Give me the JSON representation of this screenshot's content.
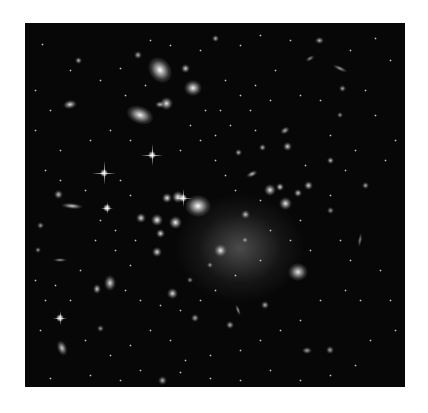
{
  "image": {
    "subject": "galaxy-cluster-deep-field",
    "description": "Black-and-white astronomical photograph of a dense galaxy cluster with a bright central concentration, elliptical galaxies, lensing arcs and diffraction-spike stars"
  },
  "galaxies": [
    {
      "x": 160,
      "y": 70,
      "w": 22,
      "h": 28,
      "rot": -35,
      "b": 1.0
    },
    {
      "x": 193,
      "y": 88,
      "w": 18,
      "h": 16,
      "rot": 0,
      "b": 0.95
    },
    {
      "x": 140,
      "y": 115,
      "w": 28,
      "h": 18,
      "rot": 20,
      "b": 0.95
    },
    {
      "x": 166,
      "y": 103,
      "w": 13,
      "h": 13,
      "rot": 0,
      "b": 0.9
    },
    {
      "x": 185,
      "y": 68,
      "w": 9,
      "h": 9,
      "rot": 0,
      "b": 0.8
    },
    {
      "x": 198,
      "y": 206,
      "w": 26,
      "h": 22,
      "rot": 0,
      "b": 1.0
    },
    {
      "x": 178,
      "y": 197,
      "w": 12,
      "h": 12,
      "rot": 0,
      "b": 0.95
    },
    {
      "x": 167,
      "y": 198,
      "w": 10,
      "h": 10,
      "rot": 0,
      "b": 0.9
    },
    {
      "x": 157,
      "y": 220,
      "w": 12,
      "h": 12,
      "rot": 0,
      "b": 0.95
    },
    {
      "x": 175,
      "y": 222,
      "w": 13,
      "h": 13,
      "rot": 0,
      "b": 0.95
    },
    {
      "x": 160,
      "y": 233,
      "w": 9,
      "h": 9,
      "rot": 0,
      "b": 0.85
    },
    {
      "x": 141,
      "y": 218,
      "w": 10,
      "h": 10,
      "rot": 0,
      "b": 0.85
    },
    {
      "x": 157,
      "y": 252,
      "w": 10,
      "h": 10,
      "rot": 0,
      "b": 0.85
    },
    {
      "x": 270,
      "y": 190,
      "w": 12,
      "h": 12,
      "rot": 0,
      "b": 0.9
    },
    {
      "x": 285,
      "y": 203,
      "w": 13,
      "h": 13,
      "rot": 0,
      "b": 0.9
    },
    {
      "x": 280,
      "y": 187,
      "w": 8,
      "h": 8,
      "rot": 0,
      "b": 0.85
    },
    {
      "x": 220,
      "y": 250,
      "w": 13,
      "h": 13,
      "rot": 0,
      "b": 0.9
    },
    {
      "x": 298,
      "y": 272,
      "w": 20,
      "h": 18,
      "rot": 0,
      "b": 0.9
    },
    {
      "x": 110,
      "y": 283,
      "w": 12,
      "h": 16,
      "rot": 0,
      "b": 0.85
    },
    {
      "x": 172,
      "y": 293,
      "w": 11,
      "h": 11,
      "rot": 0,
      "b": 0.85
    },
    {
      "x": 70,
      "y": 104,
      "w": 14,
      "h": 9,
      "rot": -10,
      "b": 0.85
    },
    {
      "x": 72,
      "y": 206,
      "w": 22,
      "h": 6,
      "rot": 5,
      "b": 0.8
    },
    {
      "x": 58,
      "y": 194,
      "w": 9,
      "h": 9,
      "rot": 0,
      "b": 0.75
    },
    {
      "x": 97,
      "y": 289,
      "w": 8,
      "h": 10,
      "rot": 0,
      "b": 0.8
    },
    {
      "x": 62,
      "y": 348,
      "w": 10,
      "h": 16,
      "rot": -20,
      "b": 0.8
    },
    {
      "x": 287,
      "y": 146,
      "w": 9,
      "h": 9,
      "rot": 0,
      "b": 0.8
    },
    {
      "x": 308,
      "y": 185,
      "w": 9,
      "h": 9,
      "rot": 0,
      "b": 0.8
    },
    {
      "x": 298,
      "y": 193,
      "w": 8,
      "h": 8,
      "rot": 0,
      "b": 0.8
    },
    {
      "x": 330,
      "y": 160,
      "w": 7,
      "h": 7,
      "rot": 0,
      "b": 0.75
    },
    {
      "x": 262,
      "y": 147,
      "w": 7,
      "h": 7,
      "rot": 0,
      "b": 0.7
    },
    {
      "x": 238,
      "y": 152,
      "w": 7,
      "h": 7,
      "rot": 0,
      "b": 0.7
    },
    {
      "x": 252,
      "y": 174,
      "w": 12,
      "h": 6,
      "rot": -25,
      "b": 0.75
    },
    {
      "x": 245,
      "y": 214,
      "w": 9,
      "h": 9,
      "rot": 0,
      "b": 0.75
    },
    {
      "x": 285,
      "y": 130,
      "w": 10,
      "h": 7,
      "rot": -30,
      "b": 0.7
    },
    {
      "x": 319,
      "y": 40,
      "w": 9,
      "h": 7,
      "rot": 0,
      "b": 0.7
    },
    {
      "x": 215,
      "y": 38,
      "w": 7,
      "h": 7,
      "rot": 0,
      "b": 0.7
    },
    {
      "x": 138,
      "y": 55,
      "w": 8,
      "h": 8,
      "rot": 0,
      "b": 0.7
    },
    {
      "x": 78,
      "y": 60,
      "w": 7,
      "h": 7,
      "rot": 0,
      "b": 0.7
    },
    {
      "x": 160,
      "y": 104,
      "w": 10,
      "h": 7,
      "rot": 0,
      "b": 0.7
    },
    {
      "x": 265,
      "y": 305,
      "w": 8,
      "h": 8,
      "rot": 0,
      "b": 0.7
    },
    {
      "x": 230,
      "y": 325,
      "w": 8,
      "h": 8,
      "rot": 0,
      "b": 0.7
    },
    {
      "x": 195,
      "y": 318,
      "w": 8,
      "h": 8,
      "rot": 0,
      "b": 0.7
    },
    {
      "x": 342,
      "y": 88,
      "w": 7,
      "h": 7,
      "rot": 0,
      "b": 0.65
    },
    {
      "x": 307,
      "y": 350,
      "w": 10,
      "h": 7,
      "rot": 0,
      "b": 0.65
    },
    {
      "x": 330,
      "y": 350,
      "w": 8,
      "h": 8,
      "rot": 0,
      "b": 0.65
    },
    {
      "x": 162,
      "y": 380,
      "w": 9,
      "h": 9,
      "rot": 0,
      "b": 0.7
    },
    {
      "x": 100,
      "y": 328,
      "w": 7,
      "h": 7,
      "rot": 0,
      "b": 0.6
    },
    {
      "x": 60,
      "y": 260,
      "w": 14,
      "h": 4,
      "rot": 0,
      "b": 0.6
    },
    {
      "x": 340,
      "y": 115,
      "w": 6,
      "h": 6,
      "rot": 0,
      "b": 0.6
    },
    {
      "x": 365,
      "y": 185,
      "w": 7,
      "h": 7,
      "rot": 0,
      "b": 0.65
    },
    {
      "x": 40,
      "y": 225,
      "w": 7,
      "h": 7,
      "rot": 0,
      "b": 0.6
    },
    {
      "x": 38,
      "y": 250,
      "w": 6,
      "h": 6,
      "rot": 0,
      "b": 0.6
    },
    {
      "x": 340,
      "y": 68,
      "w": 16,
      "h": 5,
      "rot": 25,
      "b": 0.6
    },
    {
      "x": 310,
      "y": 58,
      "w": 10,
      "h": 5,
      "rot": -30,
      "b": 0.55
    },
    {
      "x": 360,
      "y": 240,
      "w": 4,
      "h": 14,
      "rot": 10,
      "b": 0.55
    },
    {
      "x": 330,
      "y": 210,
      "w": 7,
      "h": 7,
      "rot": 0,
      "b": 0.6
    },
    {
      "x": 245,
      "y": 240,
      "w": 6,
      "h": 6,
      "rot": 0,
      "b": 0.6
    },
    {
      "x": 210,
      "y": 265,
      "w": 6,
      "h": 6,
      "rot": 0,
      "b": 0.6
    },
    {
      "x": 190,
      "y": 280,
      "w": 6,
      "h": 6,
      "rot": 0,
      "b": 0.6
    },
    {
      "x": 238,
      "y": 310,
      "w": 4,
      "h": 12,
      "rot": -20,
      "b": 0.6
    }
  ],
  "stars": [
    {
      "x": 152,
      "y": 155,
      "len": 22
    },
    {
      "x": 104,
      "y": 173,
      "len": 24
    },
    {
      "x": 183,
      "y": 198,
      "len": 18
    },
    {
      "x": 107,
      "y": 208,
      "len": 12
    },
    {
      "x": 60,
      "y": 318,
      "len": 14
    }
  ],
  "dots": [
    [
      42,
      44
    ],
    [
      70,
      70
    ],
    [
      100,
      80
    ],
    [
      120,
      68
    ],
    [
      200,
      50
    ],
    [
      240,
      45
    ],
    [
      260,
      35
    ],
    [
      290,
      40
    ],
    [
      350,
      50
    ],
    [
      375,
      38
    ],
    [
      390,
      60
    ],
    [
      365,
      90
    ],
    [
      375,
      115
    ],
    [
      395,
      140
    ],
    [
      385,
      160
    ],
    [
      330,
      135
    ],
    [
      320,
      100
    ],
    [
      300,
      95
    ],
    [
      270,
      100
    ],
    [
      250,
      110
    ],
    [
      230,
      125
    ],
    [
      215,
      135
    ],
    [
      200,
      140
    ],
    [
      180,
      150
    ],
    [
      130,
      140
    ],
    [
      110,
      130
    ],
    [
      90,
      140
    ],
    [
      60,
      150
    ],
    [
      45,
      170
    ],
    [
      60,
      180
    ],
    [
      85,
      190
    ],
    [
      120,
      180
    ],
    [
      130,
      195
    ],
    [
      135,
      240
    ],
    [
      115,
      250
    ],
    [
      95,
      240
    ],
    [
      80,
      270
    ],
    [
      55,
      285
    ],
    [
      45,
      300
    ],
    [
      70,
      300
    ],
    [
      85,
      340
    ],
    [
      110,
      355
    ],
    [
      130,
      345
    ],
    [
      150,
      330
    ],
    [
      170,
      340
    ],
    [
      185,
      360
    ],
    [
      210,
      355
    ],
    [
      240,
      350
    ],
    [
      260,
      340
    ],
    [
      280,
      330
    ],
    [
      300,
      320
    ],
    [
      320,
      300
    ],
    [
      345,
      290
    ],
    [
      360,
      300
    ],
    [
      380,
      270
    ],
    [
      390,
      300
    ],
    [
      395,
      330
    ],
    [
      370,
      340
    ],
    [
      355,
      365
    ],
    [
      330,
      375
    ],
    [
      300,
      380
    ],
    [
      270,
      370
    ],
    [
      240,
      380
    ],
    [
      210,
      378
    ],
    [
      180,
      372
    ],
    [
      140,
      370
    ],
    [
      120,
      380
    ],
    [
      90,
      375
    ],
    [
      50,
      378
    ],
    [
      40,
      330
    ],
    [
      35,
      280
    ],
    [
      35,
      130
    ],
    [
      35,
      90
    ],
    [
      50,
      110
    ],
    [
      150,
      40
    ],
    [
      170,
      45
    ],
    [
      225,
      80
    ],
    [
      240,
      95
    ],
    [
      255,
      85
    ],
    [
      275,
      70
    ],
    [
      220,
      110
    ],
    [
      215,
      160
    ],
    [
      225,
      175
    ],
    [
      235,
      190
    ],
    [
      260,
      200
    ],
    [
      270,
      230
    ],
    [
      290,
      240
    ],
    [
      310,
      250
    ],
    [
      340,
      240
    ],
    [
      350,
      260
    ],
    [
      300,
      220
    ],
    [
      260,
      260
    ],
    [
      235,
      275
    ],
    [
      215,
      290
    ],
    [
      200,
      300
    ],
    [
      180,
      310
    ],
    [
      160,
      305
    ],
    [
      140,
      300
    ],
    [
      125,
      290
    ],
    [
      130,
      265
    ],
    [
      115,
      230
    ],
    [
      100,
      220
    ],
    [
      330,
      195
    ],
    [
      345,
      170
    ],
    [
      355,
      150
    ],
    [
      305,
      165
    ],
    [
      255,
      130
    ],
    [
      190,
      125
    ],
    [
      205,
      110
    ],
    [
      145,
      85
    ],
    [
      125,
      95
    ]
  ]
}
